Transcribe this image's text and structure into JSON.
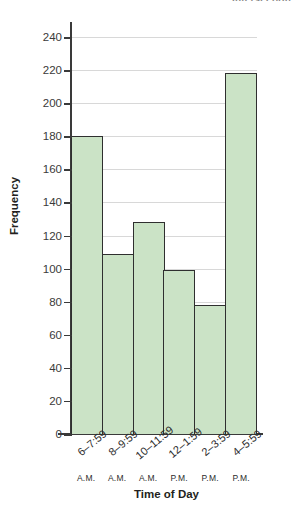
{
  "chart_data": {
    "type": "bar",
    "title": "Intersection",
    "title_note": "Title is cropped at the top edge of the screenshot; only the trailing word is visible.",
    "xlabel": "Time of Day",
    "ylabel": "Frequency",
    "categories": [
      "6–7:59",
      "8–9:59",
      "10–11:59",
      "12–1:59",
      "2–3:59",
      "4–5:59"
    ],
    "category_meridiems": [
      "A.M.",
      "A.M.",
      "A.M.",
      "P.M.",
      "P.M.",
      "P.M."
    ],
    "values": [
      180,
      109,
      128,
      99,
      78,
      218
    ],
    "ylim": [
      0,
      240
    ],
    "ytick_step": 20,
    "yticks": [
      0,
      20,
      40,
      60,
      80,
      100,
      120,
      140,
      160,
      180,
      200,
      220,
      240
    ],
    "grid": true,
    "legend": false,
    "bar_fill_color": "#cbe3c6",
    "bar_edge_color": "#2f2f2f",
    "axis_color": "#3a3a3a",
    "gridline_color": "#d8d8d8"
  }
}
